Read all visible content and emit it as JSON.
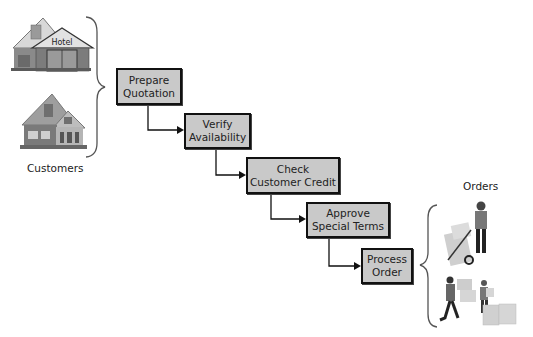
{
  "diagram": {
    "left_group_label": "Customers",
    "right_group_label": "Orders",
    "hotel_sign": "Hotel",
    "steps": [
      {
        "line1": "Prepare",
        "line2": "Quotation"
      },
      {
        "line1": "Verify",
        "line2": "Availability"
      },
      {
        "line1": "Check",
        "line2": "Customer Credit"
      },
      {
        "line1": "Approve",
        "line2": "Special Terms"
      },
      {
        "line1": "Process",
        "line2": "Order"
      }
    ],
    "colors": {
      "box_fill": "#c9c9c9",
      "box_border": "#111111",
      "connector": "#111111",
      "brace": "#555555"
    }
  }
}
